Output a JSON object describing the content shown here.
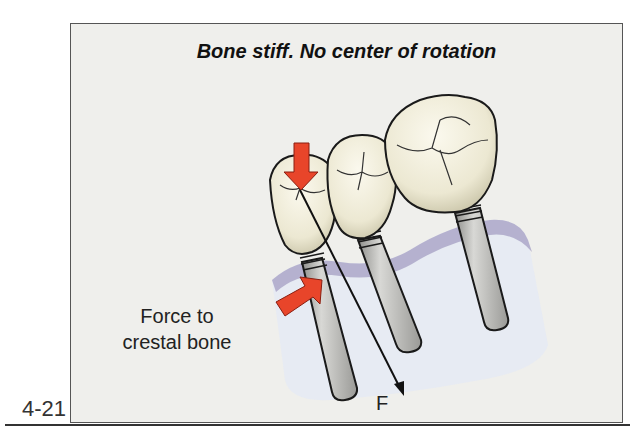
{
  "figure": {
    "title": "Bone stiff. No center of rotation",
    "number": "4-21",
    "labels": {
      "crestal_force_line1": "Force to",
      "crestal_force_line2": "crestal bone",
      "force_vector": "F"
    },
    "colors": {
      "background": "#efefec",
      "frame": "#555555",
      "bone": "#e4e8f2",
      "bone_edge": "#9a96b8",
      "crown": "#f1eedd",
      "implant": "#b9b9b6",
      "arrow_red": "#e8452a",
      "outline": "#1a1a1a"
    },
    "elements": {
      "implants": 3,
      "crowns": 3,
      "red_arrows": 2,
      "force_vector": "F"
    }
  }
}
